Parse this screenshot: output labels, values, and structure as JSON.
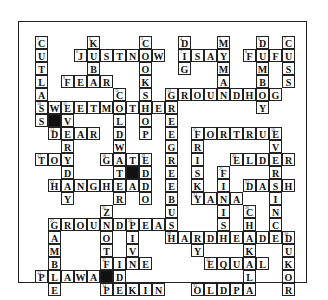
{
  "puzzle": {
    "origin": {
      "x": 34,
      "y": 35
    },
    "cell_size": 13,
    "cells": [
      {
        "r": 0,
        "c": 0,
        "ch": "C",
        "n": "1"
      },
      {
        "r": 1,
        "c": 0,
        "ch": "U"
      },
      {
        "r": 2,
        "c": 0,
        "ch": "T"
      },
      {
        "r": 3,
        "c": 0,
        "ch": "L"
      },
      {
        "r": 4,
        "c": 0,
        "ch": "A"
      },
      {
        "r": 5,
        "c": 0,
        "ch": "S",
        "n": "10"
      },
      {
        "r": 6,
        "c": 0,
        "ch": "S"
      },
      {
        "r": 0,
        "c": 4,
        "ch": "K",
        "n": "2"
      },
      {
        "r": 2,
        "c": 4,
        "ch": "B"
      },
      {
        "r": 1,
        "c": 3,
        "ch": "J",
        "n": "6"
      },
      {
        "r": 1,
        "c": 4,
        "ch": "U"
      },
      {
        "r": 1,
        "c": 5,
        "ch": "S"
      },
      {
        "r": 1,
        "c": 6,
        "ch": "T"
      },
      {
        "r": 1,
        "c": 7,
        "ch": "N"
      },
      {
        "r": 1,
        "c": 8,
        "ch": "O"
      },
      {
        "r": 1,
        "c": 9,
        "ch": "W"
      },
      {
        "r": 0,
        "c": 8,
        "ch": "C",
        "n": "3"
      },
      {
        "r": 2,
        "c": 8,
        "ch": "O"
      },
      {
        "r": 3,
        "c": 8,
        "ch": "K"
      },
      {
        "r": 4,
        "c": 8,
        "ch": "S"
      },
      {
        "r": 3,
        "c": 2,
        "ch": "F",
        "n": "9"
      },
      {
        "r": 3,
        "c": 3,
        "ch": "E"
      },
      {
        "r": 3,
        "c": 4,
        "ch": "A"
      },
      {
        "r": 3,
        "c": 5,
        "ch": "R"
      },
      {
        "r": 0,
        "c": 11,
        "ch": "D",
        "n": "4"
      },
      {
        "r": 1,
        "c": 11,
        "ch": "I",
        "n": "7"
      },
      {
        "r": 2,
        "c": 11,
        "ch": "G"
      },
      {
        "r": 1,
        "c": 12,
        "ch": "S"
      },
      {
        "r": 1,
        "c": 13,
        "ch": "A"
      },
      {
        "r": 1,
        "c": 14,
        "ch": "Y"
      },
      {
        "r": 0,
        "c": 14,
        "ch": "M",
        "n": "5"
      },
      {
        "r": 2,
        "c": 14,
        "ch": "M"
      },
      {
        "r": 3,
        "c": 14,
        "ch": "A"
      },
      {
        "r": 0,
        "c": 17,
        "ch": "D",
        "n": "6"
      },
      {
        "r": 2,
        "c": 17,
        "ch": "M"
      },
      {
        "r": 3,
        "c": 17,
        "ch": "B"
      },
      {
        "r": 5,
        "c": 17,
        "ch": "Y"
      },
      {
        "r": 1,
        "c": 16,
        "ch": "F",
        "n": "8"
      },
      {
        "r": 1,
        "c": 17,
        "ch": "U"
      },
      {
        "r": 1,
        "c": 18,
        "ch": "F"
      },
      {
        "r": 1,
        "c": 19,
        "ch": "U"
      },
      {
        "r": 0,
        "c": 19,
        "ch": "C",
        "n": "7"
      },
      {
        "r": 2,
        "c": 19,
        "ch": "S"
      },
      {
        "r": 3,
        "c": 19,
        "ch": "S"
      },
      {
        "r": 4,
        "c": 6,
        "ch": "C",
        "n": "11"
      },
      {
        "r": 6,
        "c": 6,
        "ch": "L"
      },
      {
        "r": 7,
        "c": 6,
        "ch": "D"
      },
      {
        "r": 8,
        "c": 6,
        "ch": "W"
      },
      {
        "r": 10,
        "c": 6,
        "ch": "T"
      },
      {
        "r": 11,
        "c": 6,
        "ch": "E"
      },
      {
        "r": 12,
        "c": 6,
        "ch": "R"
      },
      {
        "r": 4,
        "c": 10,
        "ch": "G",
        "n": "12"
      },
      {
        "r": 4,
        "c": 11,
        "ch": "R"
      },
      {
        "r": 4,
        "c": 12,
        "ch": "O"
      },
      {
        "r": 4,
        "c": 13,
        "ch": "U"
      },
      {
        "r": 4,
        "c": 14,
        "ch": "N"
      },
      {
        "r": 4,
        "c": 15,
        "ch": "D"
      },
      {
        "r": 4,
        "c": 16,
        "ch": "H"
      },
      {
        "r": 4,
        "c": 17,
        "ch": "O"
      },
      {
        "r": 4,
        "c": 18,
        "ch": "G"
      },
      {
        "r": 5,
        "c": 1,
        "ch": "W"
      },
      {
        "r": 5,
        "c": 2,
        "ch": "E",
        "n": "11"
      },
      {
        "r": 5,
        "c": 3,
        "ch": "E"
      },
      {
        "r": 5,
        "c": 4,
        "ch": "T"
      },
      {
        "r": 5,
        "c": 5,
        "ch": "M"
      },
      {
        "r": 5,
        "c": 6,
        "ch": "O"
      },
      {
        "r": 5,
        "c": 7,
        "ch": "T"
      },
      {
        "r": 5,
        "c": 8,
        "ch": "H"
      },
      {
        "r": 5,
        "c": 9,
        "ch": "E"
      },
      {
        "r": 5,
        "c": 10,
        "ch": "R"
      },
      {
        "r": 6,
        "c": 1,
        "ch": "",
        "black": true
      },
      {
        "r": 6,
        "c": 2,
        "ch": "V"
      },
      {
        "r": 6,
        "c": 8,
        "ch": "O"
      },
      {
        "r": 6,
        "c": 10,
        "ch": "E"
      },
      {
        "r": 7,
        "c": 1,
        "ch": "D",
        "n": "14"
      },
      {
        "r": 7,
        "c": 2,
        "ch": "E"
      },
      {
        "r": 7,
        "c": 3,
        "ch": "A"
      },
      {
        "r": 7,
        "c": 4,
        "ch": "R"
      },
      {
        "r": 7,
        "c": 8,
        "ch": "P"
      },
      {
        "r": 7,
        "c": 10,
        "ch": "E"
      },
      {
        "r": 7,
        "c": 12,
        "ch": "F",
        "n": "15"
      },
      {
        "r": 7,
        "c": 13,
        "ch": "O"
      },
      {
        "r": 7,
        "c": 14,
        "ch": "R"
      },
      {
        "r": 7,
        "c": 15,
        "ch": "T"
      },
      {
        "r": 7,
        "c": 16,
        "ch": "R"
      },
      {
        "r": 7,
        "c": 17,
        "ch": "U"
      },
      {
        "r": 7,
        "c": 18,
        "ch": "E",
        "n": "16"
      },
      {
        "r": 8,
        "c": 2,
        "ch": "R"
      },
      {
        "r": 8,
        "c": 10,
        "ch": "G"
      },
      {
        "r": 8,
        "c": 12,
        "ch": "R"
      },
      {
        "r": 8,
        "c": 18,
        "ch": "V"
      },
      {
        "r": 9,
        "c": 0,
        "ch": "T",
        "n": "17"
      },
      {
        "r": 9,
        "c": 1,
        "ch": "O"
      },
      {
        "r": 9,
        "c": 2,
        "ch": "Y"
      },
      {
        "r": 9,
        "c": 5,
        "ch": "G",
        "n": "18"
      },
      {
        "r": 9,
        "c": 6,
        "ch": "A"
      },
      {
        "r": 9,
        "c": 7,
        "ch": "T"
      },
      {
        "r": 9,
        "c": 8,
        "ch": "E",
        "n": "19"
      },
      {
        "r": 9,
        "c": 10,
        "ch": "R"
      },
      {
        "r": 9,
        "c": 12,
        "ch": "I"
      },
      {
        "r": 9,
        "c": 15,
        "ch": "E",
        "n": "20"
      },
      {
        "r": 9,
        "c": 16,
        "ch": "L"
      },
      {
        "r": 9,
        "c": 17,
        "ch": "D"
      },
      {
        "r": 9,
        "c": 18,
        "ch": "E"
      },
      {
        "r": 9,
        "c": 19,
        "ch": "R"
      },
      {
        "r": 10,
        "c": 2,
        "ch": "D"
      },
      {
        "r": 10,
        "c": 7,
        "ch": "",
        "black": true
      },
      {
        "r": 10,
        "c": 8,
        "ch": "D"
      },
      {
        "r": 10,
        "c": 10,
        "ch": "E"
      },
      {
        "r": 10,
        "c": 12,
        "ch": "S"
      },
      {
        "r": 10,
        "c": 14,
        "ch": "F",
        "n": "21"
      },
      {
        "r": 10,
        "c": 18,
        "ch": "R"
      },
      {
        "r": 11,
        "c": 1,
        "ch": "H",
        "n": "22"
      },
      {
        "r": 11,
        "c": 2,
        "ch": "A"
      },
      {
        "r": 11,
        "c": 3,
        "ch": "N"
      },
      {
        "r": 11,
        "c": 4,
        "ch": "G"
      },
      {
        "r": 11,
        "c": 5,
        "ch": "H"
      },
      {
        "r": 11,
        "c": 7,
        "ch": "A"
      },
      {
        "r": 11,
        "c": 8,
        "ch": "D"
      },
      {
        "r": 11,
        "c": 10,
        "ch": "E"
      },
      {
        "r": 11,
        "c": 12,
        "ch": "K"
      },
      {
        "r": 11,
        "c": 14,
        "ch": "I"
      },
      {
        "r": 11,
        "c": 16,
        "ch": "D",
        "n": "23"
      },
      {
        "r": 11,
        "c": 17,
        "ch": "A"
      },
      {
        "r": 11,
        "c": 18,
        "ch": "S"
      },
      {
        "r": 11,
        "c": 19,
        "ch": "H"
      },
      {
        "r": 12,
        "c": 2,
        "ch": "Y"
      },
      {
        "r": 12,
        "c": 8,
        "ch": "O"
      },
      {
        "r": 12,
        "c": 10,
        "ch": "B"
      },
      {
        "r": 12,
        "c": 12,
        "ch": "Y",
        "n": "24"
      },
      {
        "r": 12,
        "c": 13,
        "ch": "A"
      },
      {
        "r": 12,
        "c": 14,
        "ch": "N"
      },
      {
        "r": 12,
        "c": 15,
        "ch": "A"
      },
      {
        "r": 12,
        "c": 18,
        "ch": "I"
      },
      {
        "r": 13,
        "c": 5,
        "ch": "Z",
        "n": "25"
      },
      {
        "r": 13,
        "c": 10,
        "ch": "U"
      },
      {
        "r": 13,
        "c": 14,
        "ch": "I"
      },
      {
        "r": 13,
        "c": 16,
        "ch": "C",
        "n": "26"
      },
      {
        "r": 13,
        "c": 18,
        "ch": "N"
      },
      {
        "r": 14,
        "c": 1,
        "ch": "G",
        "n": "27"
      },
      {
        "r": 14,
        "c": 2,
        "ch": "R"
      },
      {
        "r": 14,
        "c": 3,
        "ch": "O"
      },
      {
        "r": 14,
        "c": 4,
        "ch": "U"
      },
      {
        "r": 14,
        "c": 5,
        "ch": "N"
      },
      {
        "r": 14,
        "c": 6,
        "ch": "D"
      },
      {
        "r": 14,
        "c": 7,
        "ch": "P",
        "n": "28"
      },
      {
        "r": 14,
        "c": 8,
        "ch": "E"
      },
      {
        "r": 14,
        "c": 9,
        "ch": "A"
      },
      {
        "r": 14,
        "c": 10,
        "ch": "S"
      },
      {
        "r": 14,
        "c": 14,
        "ch": "S"
      },
      {
        "r": 14,
        "c": 16,
        "ch": "H"
      },
      {
        "r": 14,
        "c": 18,
        "ch": "C"
      },
      {
        "r": 15,
        "c": 1,
        "ch": "A"
      },
      {
        "r": 15,
        "c": 5,
        "ch": "O"
      },
      {
        "r": 15,
        "c": 7,
        "ch": "I"
      },
      {
        "r": 15,
        "c": 10,
        "ch": "H",
        "n": "29"
      },
      {
        "r": 15,
        "c": 11,
        "ch": "A"
      },
      {
        "r": 15,
        "c": 12,
        "ch": "R"
      },
      {
        "r": 15,
        "c": 13,
        "ch": "D"
      },
      {
        "r": 15,
        "c": 14,
        "ch": "H"
      },
      {
        "r": 15,
        "c": 15,
        "ch": "E"
      },
      {
        "r": 15,
        "c": 16,
        "ch": "A"
      },
      {
        "r": 15,
        "c": 17,
        "ch": "D"
      },
      {
        "r": 15,
        "c": 18,
        "ch": "E"
      },
      {
        "r": 15,
        "c": 19,
        "ch": "D",
        "n": "30"
      },
      {
        "r": 16,
        "c": 1,
        "ch": "M"
      },
      {
        "r": 16,
        "c": 5,
        "ch": "T"
      },
      {
        "r": 16,
        "c": 7,
        "ch": "V"
      },
      {
        "r": 16,
        "c": 12,
        "ch": "Y"
      },
      {
        "r": 16,
        "c": 16,
        "ch": "K"
      },
      {
        "r": 16,
        "c": 19,
        "ch": "U"
      },
      {
        "r": 17,
        "c": 1,
        "ch": "B"
      },
      {
        "r": 17,
        "c": 5,
        "ch": "F",
        "n": "31"
      },
      {
        "r": 17,
        "c": 6,
        "ch": "I"
      },
      {
        "r": 17,
        "c": 7,
        "ch": "N"
      },
      {
        "r": 17,
        "c": 8,
        "ch": "E"
      },
      {
        "r": 17,
        "c": 13,
        "ch": "E",
        "n": "32"
      },
      {
        "r": 17,
        "c": 14,
        "ch": "Q"
      },
      {
        "r": 17,
        "c": 15,
        "ch": "U"
      },
      {
        "r": 17,
        "c": 16,
        "ch": "A"
      },
      {
        "r": 17,
        "c": 17,
        "ch": "L"
      },
      {
        "r": 17,
        "c": 19,
        "ch": "K"
      },
      {
        "r": 18,
        "c": 0,
        "ch": "P",
        "n": "33"
      },
      {
        "r": 18,
        "c": 1,
        "ch": "L"
      },
      {
        "r": 18,
        "c": 2,
        "ch": "A"
      },
      {
        "r": 18,
        "c": 3,
        "ch": "W"
      },
      {
        "r": 18,
        "c": 4,
        "ch": "A"
      },
      {
        "r": 18,
        "c": 5,
        "ch": "",
        "black": true
      },
      {
        "r": 18,
        "c": 6,
        "ch": "D"
      },
      {
        "r": 18,
        "c": 16,
        "ch": "L"
      },
      {
        "r": 18,
        "c": 19,
        "ch": "O"
      },
      {
        "r": 19,
        "c": 1,
        "ch": "E"
      },
      {
        "r": 19,
        "c": 5,
        "ch": "P",
        "n": "34"
      },
      {
        "r": 19,
        "c": 6,
        "ch": "E"
      },
      {
        "r": 19,
        "c": 7,
        "ch": "K"
      },
      {
        "r": 19,
        "c": 8,
        "ch": "I"
      },
      {
        "r": 19,
        "c": 9,
        "ch": "N"
      },
      {
        "r": 19,
        "c": 12,
        "ch": "O",
        "n": "35"
      },
      {
        "r": 19,
        "c": 13,
        "ch": "L"
      },
      {
        "r": 19,
        "c": 14,
        "ch": "D"
      },
      {
        "r": 19,
        "c": 15,
        "ch": "P"
      },
      {
        "r": 19,
        "c": 16,
        "ch": "A"
      },
      {
        "r": 19,
        "c": 19,
        "ch": "R"
      }
    ]
  }
}
